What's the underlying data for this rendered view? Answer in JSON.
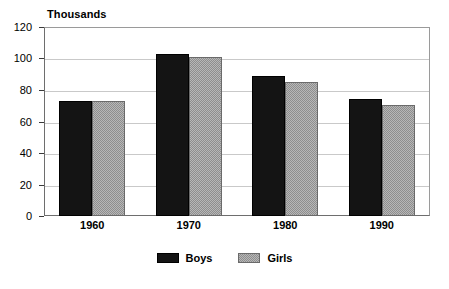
{
  "chart_data": {
    "type": "bar",
    "title": "Thousands",
    "xlabel": "",
    "ylabel": "",
    "categories": [
      "1960",
      "1970",
      "1980",
      "1990"
    ],
    "series": [
      {
        "name": "Boys",
        "values": [
          73,
          103,
          89,
          74
        ],
        "color": "#141414"
      },
      {
        "name": "Girls",
        "values": [
          73,
          101,
          85,
          70.5
        ],
        "color": "#b7b7b7"
      }
    ],
    "ylim": [
      0,
      120
    ],
    "yticks": [
      0,
      20,
      40,
      60,
      80,
      100,
      120
    ],
    "ytick_labels": [
      "0",
      "20",
      "40",
      "60",
      "80",
      "100",
      "120"
    ],
    "grid": true,
    "grid_axis": "y",
    "legend_position": "bottom-center"
  },
  "legend": {
    "items": [
      {
        "label": "Boys"
      },
      {
        "label": "Girls"
      }
    ]
  }
}
